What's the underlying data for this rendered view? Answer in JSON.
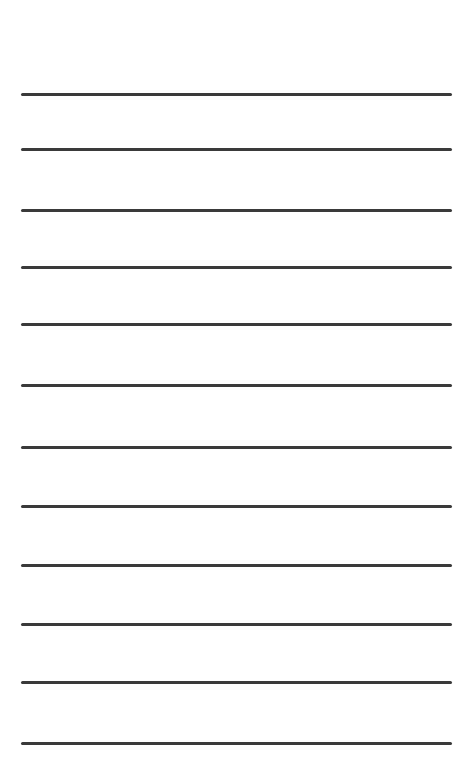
{
  "page": {
    "type": "lined-paper",
    "background_color": "#ffffff",
    "rule_color": "#3a3a3a",
    "rule_thickness_px": 3,
    "rule_left_px": 21,
    "rule_right_px": 452,
    "rules": [
      {
        "index": 1,
        "y": 93
      },
      {
        "index": 2,
        "y": 148
      },
      {
        "index": 3,
        "y": 209
      },
      {
        "index": 4,
        "y": 266
      },
      {
        "index": 5,
        "y": 323
      },
      {
        "index": 6,
        "y": 384
      },
      {
        "index": 7,
        "y": 446
      },
      {
        "index": 8,
        "y": 505
      },
      {
        "index": 9,
        "y": 564
      },
      {
        "index": 10,
        "y": 623
      },
      {
        "index": 11,
        "y": 681
      },
      {
        "index": 12,
        "y": 742
      }
    ]
  }
}
